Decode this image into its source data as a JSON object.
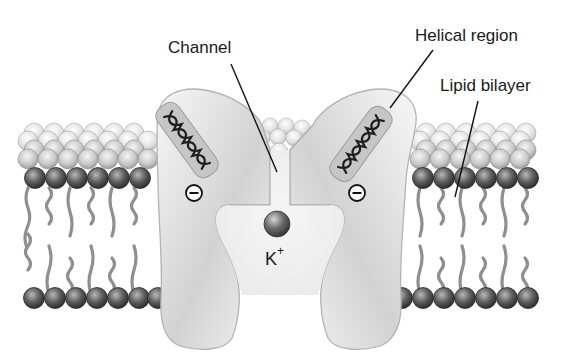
{
  "diagram": {
    "type": "ion-channel-cross-section",
    "labels": {
      "channel": "Channel",
      "helical_region": "Helical region",
      "lipid_bilayer": "Lipid bilayer",
      "ion_symbol": "K",
      "ion_charge": "+"
    },
    "charges": [
      {
        "position": "left",
        "sign": "−"
      },
      {
        "position": "right",
        "sign": "−"
      }
    ],
    "colors": {
      "background": "#ffffff",
      "protein_fill": "#ededed",
      "protein_shadow": "#bdbdbd",
      "protein_outline": "#b0b0b0",
      "helix_box": "#c4c4c4",
      "lipid_head_dark": "#5a5a5a",
      "lipid_head_light": "#e6e6e6",
      "lipid_tail": "#8c8c8c",
      "ion": "#707070",
      "leader_line": "#111111"
    }
  }
}
